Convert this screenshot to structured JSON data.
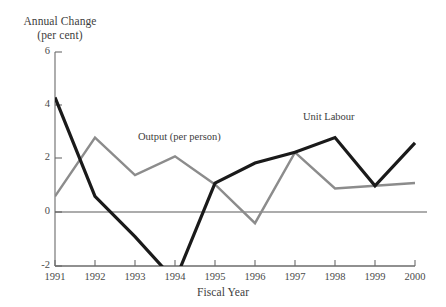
{
  "chart_data": {
    "type": "line",
    "title": "",
    "ylabel_line1": "Annual Change",
    "ylabel_line2": "(per cent)",
    "xlabel": "Fiscal Year",
    "categories": [
      "1991",
      "1992",
      "1993",
      "1994",
      "1995",
      "1996",
      "1997",
      "1998",
      "1999",
      "2000"
    ],
    "x": [
      1991,
      1992,
      1993,
      1994,
      1995,
      1996,
      1997,
      1998,
      1999,
      2000
    ],
    "ylim": [
      -2,
      6
    ],
    "xlim": [
      1991,
      2000
    ],
    "yticks": [
      -2,
      0,
      2,
      4,
      6
    ],
    "ytick_labels": [
      "-2",
      "0",
      "2",
      "4",
      "6"
    ],
    "grid": false,
    "legend": "inline-annotations",
    "zero_line": true,
    "series": [
      {
        "name": "Unit Labour",
        "color": "#1a1a1a",
        "width": 3.2,
        "values": [
          4.3,
          0.6,
          -0.9,
          -2.55,
          1.1,
          1.85,
          2.25,
          2.8,
          1.0,
          2.6
        ]
      },
      {
        "name": "Output (per person)",
        "color": "#8c8c8c",
        "width": 2.4,
        "values": [
          0.6,
          2.8,
          1.4,
          2.1,
          1.05,
          -0.4,
          2.25,
          0.9,
          1.0,
          1.1
        ]
      }
    ],
    "annotations": [
      {
        "text": "Output (per person)",
        "x": 1994.0,
        "y": 2.85
      },
      {
        "text": "Unit Labour",
        "x": 1997.5,
        "y": 3.5
      }
    ]
  },
  "ytick_positions": {
    "6": 52,
    "4": 105,
    "2": 158,
    "0": 212,
    "-2": 266
  },
  "xtick_positions": {
    "1991": 55,
    "1992": 95,
    "1993": 135,
    "1994": 175,
    "1995": 215,
    "1996": 255,
    "1997": 295,
    "1998": 335,
    "1999": 375,
    "2000": 415
  },
  "colors": {
    "unit_labour": "#1a1a1a",
    "output": "#8c8c8c",
    "axis": "#6b6b6b",
    "text": "#3d3d3d"
  }
}
